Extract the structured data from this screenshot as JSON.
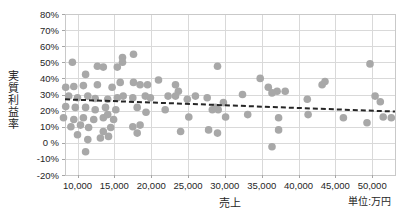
{
  "chart_data": {
    "type": "scatter",
    "title": "",
    "xlabel": "売上",
    "ylabel": "実質利益率",
    "unit_label": "単位:万円",
    "grid": true,
    "legend_position": "none",
    "x_axis": {
      "min": 8300,
      "max": 53100,
      "ticks": [
        10000,
        15000,
        20000,
        25000,
        30000,
        35000,
        40000,
        45000,
        50000
      ],
      "tick_labels": [
        "10,000",
        "15,000",
        "20,000",
        "25,000",
        "30,000",
        "35,000",
        "40,000",
        "45,000",
        "50,000"
      ]
    },
    "y_axis": {
      "min": -20,
      "max": 80,
      "ticks": [
        80,
        70,
        60,
        50,
        40,
        30,
        20,
        10,
        0,
        -10,
        -20
      ],
      "tick_labels": [
        "80%",
        "70%",
        "60%",
        "50%",
        "40%",
        "30%",
        "20%",
        "10%",
        "0 %",
        "-10%",
        "-20%"
      ]
    },
    "points": [
      [
        9300,
        50
      ],
      [
        16100,
        53
      ],
      [
        17600,
        55
      ],
      [
        12700,
        47.5
      ],
      [
        13500,
        47
      ],
      [
        15400,
        47
      ],
      [
        16100,
        50
      ],
      [
        29000,
        47.5
      ],
      [
        11100,
        42.5
      ],
      [
        49700,
        49
      ],
      [
        15800,
        37.5
      ],
      [
        8400,
        34.5
      ],
      [
        9500,
        35
      ],
      [
        10800,
        35.5
      ],
      [
        12700,
        36
      ],
      [
        14700,
        34.5
      ],
      [
        17600,
        37.5
      ],
      [
        18500,
        36
      ],
      [
        19500,
        36
      ],
      [
        21000,
        39
      ],
      [
        23300,
        36
      ],
      [
        23700,
        32
      ],
      [
        34800,
        40
      ],
      [
        35900,
        34.5
      ],
      [
        37100,
        32
      ],
      [
        43200,
        36
      ],
      [
        43600,
        38
      ],
      [
        8800,
        29
      ],
      [
        10000,
        28
      ],
      [
        11400,
        29
      ],
      [
        12400,
        27.5
      ],
      [
        14100,
        27
      ],
      [
        15400,
        28
      ],
      [
        16200,
        29
      ],
      [
        17500,
        28
      ],
      [
        19200,
        29
      ],
      [
        19900,
        28
      ],
      [
        22300,
        29
      ],
      [
        23300,
        29
      ],
      [
        24900,
        27
      ],
      [
        26000,
        29
      ],
      [
        27600,
        28
      ],
      [
        29800,
        25
      ],
      [
        32400,
        30
      ],
      [
        36400,
        31
      ],
      [
        38200,
        32
      ],
      [
        8400,
        22.5
      ],
      [
        9700,
        22
      ],
      [
        11100,
        22
      ],
      [
        12400,
        20.5
      ],
      [
        13800,
        22
      ],
      [
        15200,
        20.5
      ],
      [
        18100,
        22
      ],
      [
        19300,
        19
      ],
      [
        21900,
        20.5
      ],
      [
        28300,
        20.5
      ],
      [
        28700,
        22
      ],
      [
        29100,
        20.5
      ],
      [
        8100,
        15.5
      ],
      [
        9500,
        14.5
      ],
      [
        10800,
        15.5
      ],
      [
        12200,
        14.5
      ],
      [
        13500,
        15.5
      ],
      [
        14900,
        14.5
      ],
      [
        14100,
        17.5
      ],
      [
        25100,
        16
      ],
      [
        30100,
        16
      ],
      [
        33100,
        17.5
      ],
      [
        37300,
        15.5
      ],
      [
        41200,
        27
      ],
      [
        41300,
        17.5
      ],
      [
        46100,
        15.5
      ],
      [
        49300,
        12.5
      ],
      [
        50400,
        29
      ],
      [
        51100,
        25.5
      ],
      [
        51500,
        16
      ],
      [
        52600,
        15.5
      ],
      [
        9100,
        10
      ],
      [
        10400,
        11
      ],
      [
        11500,
        9.5
      ],
      [
        13500,
        7
      ],
      [
        14500,
        9.5
      ],
      [
        17500,
        10
      ],
      [
        18500,
        11
      ],
      [
        10000,
        5
      ],
      [
        11400,
        2
      ],
      [
        13100,
        3
      ],
      [
        14200,
        4
      ],
      [
        18100,
        6
      ],
      [
        24000,
        7
      ],
      [
        27800,
        8
      ],
      [
        29000,
        6
      ],
      [
        37300,
        8
      ],
      [
        11100,
        -5.5
      ],
      [
        36400,
        -2.5
      ]
    ],
    "trendline": {
      "type": "linear",
      "dashed": true,
      "x1": 8300,
      "y1": 27,
      "x2": 53100,
      "y2": 19.4
    },
    "colors": {
      "point": "#a8a8a8",
      "trend": "#262626",
      "grid": "#d9d9d9",
      "border": "#c9c9c9",
      "tick": "#a6a6a6",
      "text": "#262626",
      "background": "#ffffff"
    }
  }
}
